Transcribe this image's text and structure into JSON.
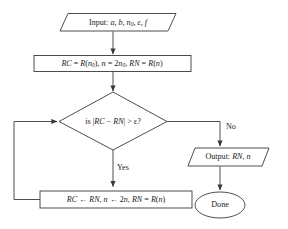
{
  "diagram": {
    "type": "flowchart",
    "background_color": "#ffffff",
    "line_color": "#3a3a3a",
    "text_color": "#1a1a1a"
  },
  "nodes": {
    "input": {
      "shape": "parallelogram",
      "label": "Input: a, b, n0, ε, f",
      "text_prefix": "Input:",
      "vars": "a, b, n",
      "subscript": "0",
      "vars_tail": ", ε, f"
    },
    "init": {
      "shape": "rectangle",
      "label": "RC = R(n0), n = 2n0, RN = R(n)",
      "seg1": "RC",
      "seg2": " = ",
      "seg3": "R",
      "seg4": "(",
      "seg5": "n",
      "sub1": "0",
      "seg6": "), ",
      "seg7": "n",
      "seg8": " = 2",
      "seg9": "n",
      "sub2": "0",
      "seg10": ", ",
      "seg11": "RN",
      "seg12": " = ",
      "seg13": "R",
      "seg14": "(",
      "seg15": "n",
      "seg16": ")"
    },
    "decision": {
      "shape": "diamond",
      "label": "is |RC − RN| > ε?",
      "prefix": "is |",
      "var1": "RC",
      "mid": " − ",
      "var2": "RN",
      "suffix": "| > ε?"
    },
    "update": {
      "shape": "rectangle",
      "label": "RC ← RN, n ← 2n, RN = R(n)",
      "p1": "RC",
      "p2": " ← ",
      "p3": "RN",
      "p4": ", ",
      "p5": "n",
      "p6": " ← 2",
      "p7": "n",
      "p8": ", ",
      "p9": "RN",
      "p10": " = ",
      "p11": "R",
      "p12": "(",
      "p13": "n",
      "p14": ")"
    },
    "output": {
      "shape": "parallelogram",
      "label": "Output: RN, n",
      "prefix": "Output: ",
      "var1": "RN",
      "sep": ", ",
      "var2": "n"
    },
    "done": {
      "shape": "ellipse",
      "label": "Done"
    }
  },
  "edges": {
    "yes_label": "Yes",
    "no_label": "No"
  }
}
